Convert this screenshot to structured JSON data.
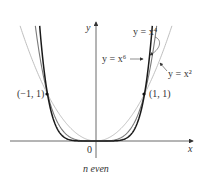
{
  "chart_data": {
    "type": "line",
    "title": "",
    "caption": "n even",
    "xlabel": "x",
    "ylabel": "y",
    "origin_label": "0",
    "xlim": [
      -1.9,
      2.0
    ],
    "ylim": [
      -0.3,
      2.5
    ],
    "grid": false,
    "series": [
      {
        "name": "y = x^2",
        "label": "y = x²",
        "exponent": 2,
        "color": "#b8b8b8"
      },
      {
        "name": "y = x^4",
        "label": "y = x⁴",
        "exponent": 4,
        "color": "#7a7a7a"
      },
      {
        "name": "y = x^6",
        "label": "y = x⁶",
        "exponent": 6,
        "color": "#1a1a1a"
      }
    ],
    "points": [
      {
        "x": -1,
        "y": 1,
        "label": "(−1, 1)"
      },
      {
        "x": 1,
        "y": 1,
        "label": "(1, 1)"
      }
    ],
    "annotations": [
      "y = x⁴",
      "y = x⁶",
      "y = x²"
    ]
  },
  "labels": {
    "y_axis": "y",
    "x_axis": "x",
    "origin": "0",
    "point_left": "(−1, 1)",
    "point_right": "(1, 1)",
    "x4": "y = x⁴",
    "x6": "y = x⁶",
    "x2": "y = x²",
    "caption": "n even"
  }
}
